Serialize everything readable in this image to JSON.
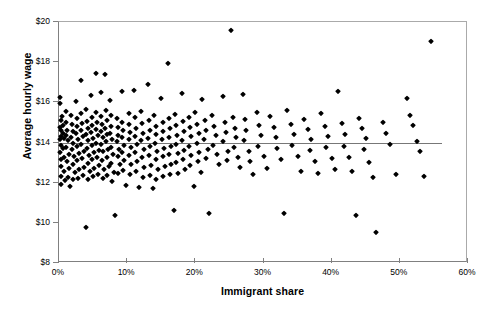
{
  "chart_data": {
    "type": "scatter",
    "title": "",
    "xlabel": "Immigrant share",
    "ylabel": "Average hourly wage",
    "xlim": [
      0,
      60
    ],
    "ylim": [
      8,
      20
    ],
    "x_ticks": [
      0,
      10,
      20,
      30,
      40,
      50,
      60
    ],
    "x_tick_labels": [
      "0%",
      "10%",
      "20%",
      "30%",
      "40%",
      "50%",
      "60%"
    ],
    "y_ticks": [
      8,
      10,
      12,
      14,
      16,
      18,
      20
    ],
    "y_tick_labels": [
      "$8",
      "$10",
      "$12",
      "$14",
      "$16",
      "$18",
      "$20"
    ],
    "grid": false,
    "legend": false,
    "marker": "diamond",
    "marker_color": "#000000",
    "trendline": {
      "type": "linear",
      "color": "#777777",
      "x_start": 0.0,
      "x_end": 56.2,
      "y_start": 13.98,
      "y_end": 14.02
    },
    "points": [
      [
        0.15,
        16.25
      ],
      [
        0.2,
        15.95
      ],
      [
        0.25,
        15.1
      ],
      [
        0.2,
        14.75
      ],
      [
        0.3,
        14.6
      ],
      [
        0.25,
        14.3
      ],
      [
        0.2,
        14.15
      ],
      [
        0.3,
        13.9
      ],
      [
        0.2,
        13.55
      ],
      [
        0.3,
        13.2
      ],
      [
        0.25,
        12.85
      ],
      [
        0.3,
        12.35
      ],
      [
        0.35,
        11.95
      ],
      [
        0.5,
        15.3
      ],
      [
        0.6,
        14.85
      ],
      [
        0.55,
        14.45
      ],
      [
        0.7,
        14.2
      ],
      [
        0.6,
        13.75
      ],
      [
        0.8,
        13.3
      ],
      [
        0.7,
        12.6
      ],
      [
        0.9,
        12.15
      ],
      [
        1.0,
        15.55
      ],
      [
        1.1,
        15.0
      ],
      [
        1.2,
        14.6
      ],
      [
        1.0,
        14.35
      ],
      [
        1.3,
        14.1
      ],
      [
        1.1,
        13.8
      ],
      [
        1.4,
        13.45
      ],
      [
        1.2,
        13.1
      ],
      [
        1.5,
        12.75
      ],
      [
        1.3,
        12.3
      ],
      [
        1.6,
        11.85
      ],
      [
        1.8,
        15.35
      ],
      [
        1.9,
        14.9
      ],
      [
        2.0,
        14.55
      ],
      [
        1.8,
        14.25
      ],
      [
        2.1,
        14.0
      ],
      [
        1.9,
        13.7
      ],
      [
        2.2,
        13.35
      ],
      [
        2.0,
        12.95
      ],
      [
        2.3,
        12.55
      ],
      [
        2.1,
        12.2
      ],
      [
        2.5,
        16.05
      ],
      [
        2.6,
        15.2
      ],
      [
        2.7,
        14.8
      ],
      [
        2.5,
        14.45
      ],
      [
        2.8,
        14.15
      ],
      [
        2.6,
        13.85
      ],
      [
        2.9,
        13.5
      ],
      [
        2.7,
        13.15
      ],
      [
        3.0,
        12.7
      ],
      [
        2.8,
        12.25
      ],
      [
        3.2,
        17.1
      ],
      [
        3.3,
        15.45
      ],
      [
        3.4,
        14.95
      ],
      [
        3.2,
        14.6
      ],
      [
        3.5,
        14.3
      ],
      [
        3.3,
        13.95
      ],
      [
        3.6,
        13.6
      ],
      [
        3.4,
        13.25
      ],
      [
        3.7,
        12.8
      ],
      [
        3.5,
        12.4
      ],
      [
        3.9,
        9.8
      ],
      [
        4.0,
        15.65
      ],
      [
        4.1,
        15.05
      ],
      [
        4.2,
        14.7
      ],
      [
        4.0,
        14.4
      ],
      [
        4.3,
        14.1
      ],
      [
        4.1,
        13.75
      ],
      [
        4.4,
        13.4
      ],
      [
        4.2,
        13.0
      ],
      [
        4.5,
        12.6
      ],
      [
        4.3,
        12.2
      ],
      [
        4.7,
        16.35
      ],
      [
        4.8,
        15.25
      ],
      [
        4.9,
        14.85
      ],
      [
        4.7,
        14.5
      ],
      [
        5.0,
        14.2
      ],
      [
        4.8,
        13.9
      ],
      [
        5.1,
        13.55
      ],
      [
        4.9,
        13.2
      ],
      [
        5.2,
        12.75
      ],
      [
        5.0,
        12.35
      ],
      [
        5.4,
        17.45
      ],
      [
        5.5,
        15.5
      ],
      [
        5.6,
        15.0
      ],
      [
        5.4,
        14.65
      ],
      [
        5.7,
        14.35
      ],
      [
        5.5,
        14.0
      ],
      [
        5.8,
        13.65
      ],
      [
        5.6,
        13.3
      ],
      [
        5.9,
        12.9
      ],
      [
        5.7,
        12.45
      ],
      [
        6.1,
        16.5
      ],
      [
        6.2,
        15.3
      ],
      [
        6.3,
        14.9
      ],
      [
        6.1,
        14.55
      ],
      [
        6.4,
        14.25
      ],
      [
        6.2,
        13.95
      ],
      [
        6.5,
        13.6
      ],
      [
        6.3,
        13.15
      ],
      [
        6.6,
        12.7
      ],
      [
        6.4,
        12.25
      ],
      [
        6.8,
        17.4
      ],
      [
        6.9,
        15.6
      ],
      [
        7.0,
        15.1
      ],
      [
        6.8,
        14.7
      ],
      [
        7.1,
        14.4
      ],
      [
        6.9,
        14.05
      ],
      [
        7.2,
        13.7
      ],
      [
        7.0,
        13.3
      ],
      [
        7.3,
        12.85
      ],
      [
        7.1,
        12.4
      ],
      [
        7.5,
        16.1
      ],
      [
        7.6,
        15.35
      ],
      [
        7.7,
        14.8
      ],
      [
        7.5,
        14.45
      ],
      [
        7.8,
        14.15
      ],
      [
        7.6,
        13.8
      ],
      [
        7.9,
        13.45
      ],
      [
        7.7,
        13.0
      ],
      [
        8.0,
        12.55
      ],
      [
        7.8,
        12.1
      ],
      [
        8.2,
        10.4
      ],
      [
        8.5,
        15.2
      ],
      [
        8.6,
        14.75
      ],
      [
        8.7,
        14.35
      ],
      [
        8.5,
        14.05
      ],
      [
        8.8,
        13.7
      ],
      [
        8.6,
        13.35
      ],
      [
        8.9,
        12.95
      ],
      [
        8.7,
        12.5
      ],
      [
        9.2,
        16.55
      ],
      [
        9.3,
        15.0
      ],
      [
        9.4,
        14.6
      ],
      [
        9.2,
        14.25
      ],
      [
        9.5,
        13.9
      ],
      [
        9.3,
        13.55
      ],
      [
        9.6,
        13.15
      ],
      [
        9.4,
        12.65
      ],
      [
        9.8,
        11.9
      ],
      [
        10.2,
        15.45
      ],
      [
        10.3,
        14.9
      ],
      [
        10.4,
        14.5
      ],
      [
        10.2,
        14.15
      ],
      [
        10.5,
        13.8
      ],
      [
        10.3,
        13.4
      ],
      [
        10.6,
        12.95
      ],
      [
        10.4,
        12.45
      ],
      [
        11.0,
        16.6
      ],
      [
        11.2,
        15.25
      ],
      [
        11.3,
        14.7
      ],
      [
        11.1,
        14.3
      ],
      [
        11.4,
        13.95
      ],
      [
        11.2,
        13.55
      ],
      [
        11.5,
        13.1
      ],
      [
        11.3,
        12.6
      ],
      [
        11.8,
        11.8
      ],
      [
        12.0,
        15.55
      ],
      [
        12.2,
        14.95
      ],
      [
        12.3,
        14.45
      ],
      [
        12.1,
        14.1
      ],
      [
        12.4,
        13.7
      ],
      [
        12.2,
        13.3
      ],
      [
        12.5,
        12.8
      ],
      [
        12.3,
        12.3
      ],
      [
        13.0,
        16.9
      ],
      [
        13.2,
        15.1
      ],
      [
        13.3,
        14.6
      ],
      [
        13.1,
        14.2
      ],
      [
        13.4,
        13.85
      ],
      [
        13.2,
        13.4
      ],
      [
        13.5,
        12.9
      ],
      [
        13.3,
        12.4
      ],
      [
        13.8,
        11.75
      ],
      [
        14.0,
        15.35
      ],
      [
        14.2,
        14.8
      ],
      [
        14.3,
        14.4
      ],
      [
        14.1,
        14.0
      ],
      [
        14.4,
        13.6
      ],
      [
        14.2,
        13.2
      ],
      [
        14.5,
        12.7
      ],
      [
        14.3,
        12.2
      ],
      [
        15.0,
        16.2
      ],
      [
        15.2,
        15.0
      ],
      [
        15.3,
        14.55
      ],
      [
        15.1,
        14.15
      ],
      [
        15.4,
        13.75
      ],
      [
        15.2,
        13.35
      ],
      [
        15.5,
        12.85
      ],
      [
        15.3,
        12.35
      ],
      [
        16.0,
        17.95
      ],
      [
        16.2,
        15.2
      ],
      [
        16.3,
        14.7
      ],
      [
        16.1,
        14.25
      ],
      [
        16.4,
        13.85
      ],
      [
        16.2,
        13.45
      ],
      [
        16.5,
        12.95
      ],
      [
        16.3,
        12.45
      ],
      [
        16.8,
        10.65
      ],
      [
        17.0,
        15.4
      ],
      [
        17.2,
        14.85
      ],
      [
        17.3,
        14.35
      ],
      [
        17.1,
        13.95
      ],
      [
        17.4,
        13.5
      ],
      [
        17.2,
        13.05
      ],
      [
        17.5,
        12.5
      ],
      [
        18.0,
        16.45
      ],
      [
        18.2,
        15.05
      ],
      [
        18.3,
        14.55
      ],
      [
        18.1,
        14.1
      ],
      [
        18.4,
        13.65
      ],
      [
        18.2,
        13.2
      ],
      [
        18.5,
        12.7
      ],
      [
        19.0,
        15.25
      ],
      [
        19.2,
        14.75
      ],
      [
        19.3,
        14.3
      ],
      [
        19.1,
        13.85
      ],
      [
        19.4,
        13.4
      ],
      [
        19.2,
        12.9
      ],
      [
        19.8,
        11.85
      ],
      [
        20.0,
        15.5
      ],
      [
        20.3,
        14.9
      ],
      [
        20.5,
        14.45
      ],
      [
        20.2,
        14.0
      ],
      [
        20.6,
        13.55
      ],
      [
        20.4,
        13.1
      ],
      [
        20.8,
        12.55
      ],
      [
        21.0,
        16.15
      ],
      [
        21.4,
        15.1
      ],
      [
        21.6,
        14.6
      ],
      [
        21.2,
        14.15
      ],
      [
        21.8,
        13.7
      ],
      [
        21.5,
        13.25
      ],
      [
        22.0,
        10.5
      ],
      [
        22.5,
        15.35
      ],
      [
        22.8,
        14.8
      ],
      [
        23.0,
        14.35
      ],
      [
        22.6,
        13.9
      ],
      [
        23.2,
        13.45
      ],
      [
        23.5,
        12.95
      ],
      [
        24.0,
        16.3
      ],
      [
        24.3,
        15.0
      ],
      [
        24.5,
        14.5
      ],
      [
        24.1,
        14.05
      ],
      [
        24.8,
        13.6
      ],
      [
        24.6,
        13.15
      ],
      [
        25.2,
        19.6
      ],
      [
        25.5,
        15.25
      ],
      [
        25.8,
        14.7
      ],
      [
        26.0,
        14.25
      ],
      [
        25.6,
        13.8
      ],
      [
        26.3,
        13.3
      ],
      [
        26.5,
        12.8
      ],
      [
        27.0,
        16.4
      ],
      [
        27.3,
        15.15
      ],
      [
        27.5,
        14.6
      ],
      [
        27.2,
        14.1
      ],
      [
        27.8,
        13.6
      ],
      [
        28.0,
        13.1
      ],
      [
        28.5,
        12.45
      ],
      [
        29.0,
        15.5
      ],
      [
        29.3,
        14.85
      ],
      [
        29.6,
        14.35
      ],
      [
        29.2,
        13.85
      ],
      [
        30.0,
        13.35
      ],
      [
        30.5,
        12.75
      ],
      [
        31.0,
        15.3
      ],
      [
        31.5,
        14.75
      ],
      [
        31.8,
        14.25
      ],
      [
        32.0,
        13.75
      ],
      [
        32.5,
        13.2
      ],
      [
        33.0,
        10.5
      ],
      [
        33.5,
        15.6
      ],
      [
        34.0,
        14.9
      ],
      [
        34.5,
        14.4
      ],
      [
        34.2,
        13.9
      ],
      [
        35.0,
        13.35
      ],
      [
        35.5,
        12.6
      ],
      [
        36.0,
        15.15
      ],
      [
        36.5,
        14.65
      ],
      [
        37.0,
        14.15
      ],
      [
        36.8,
        13.65
      ],
      [
        37.5,
        13.1
      ],
      [
        38.0,
        12.5
      ],
      [
        38.5,
        15.45
      ],
      [
        39.0,
        14.8
      ],
      [
        39.5,
        14.3
      ],
      [
        39.2,
        13.8
      ],
      [
        40.0,
        13.25
      ],
      [
        40.5,
        12.7
      ],
      [
        41.0,
        16.55
      ],
      [
        41.5,
        14.95
      ],
      [
        42.0,
        14.4
      ],
      [
        41.8,
        13.85
      ],
      [
        42.5,
        13.3
      ],
      [
        43.0,
        12.6
      ],
      [
        43.5,
        10.4
      ],
      [
        44.0,
        15.2
      ],
      [
        44.5,
        14.7
      ],
      [
        45.0,
        14.2
      ],
      [
        44.8,
        13.7
      ],
      [
        45.5,
        13.05
      ],
      [
        46.0,
        12.3
      ],
      [
        46.5,
        9.55
      ],
      [
        47.5,
        15.0
      ],
      [
        48.0,
        14.45
      ],
      [
        48.5,
        13.95
      ],
      [
        49.5,
        12.45
      ],
      [
        51.0,
        16.2
      ],
      [
        51.5,
        15.35
      ],
      [
        52.0,
        14.85
      ],
      [
        52.5,
        14.05
      ],
      [
        53.0,
        13.6
      ],
      [
        53.5,
        12.35
      ],
      [
        54.5,
        19.05
      ]
    ]
  }
}
